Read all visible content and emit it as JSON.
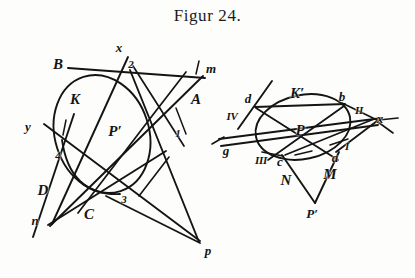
{
  "figure": {
    "title": "Figur 24.",
    "caption_style": "serif-roman",
    "ink_color": "#141414",
    "paper_color": "#fdfdfb",
    "type": "geometric-construction-plate"
  },
  "diagrams": [
    {
      "name": "left-diagram",
      "conic": {
        "name": "left-ellipse",
        "cx": 102,
        "cy": 134,
        "rx": 47,
        "ry": 60,
        "rotation_deg": -18
      },
      "labels": [
        {
          "id": "B",
          "text": "B",
          "x": 58,
          "y": 64,
          "size": "cap"
        },
        {
          "id": "x",
          "text": "x",
          "x": 119,
          "y": 47,
          "size": "small"
        },
        {
          "id": "2",
          "text": "2",
          "x": 131,
          "y": 64,
          "size": "num"
        },
        {
          "id": "m",
          "text": "m",
          "x": 211,
          "y": 68,
          "size": "small"
        },
        {
          "id": "A",
          "text": "A",
          "x": 196,
          "y": 99,
          "size": "cap"
        },
        {
          "id": "K",
          "text": "K",
          "x": 75,
          "y": 99,
          "size": "cap"
        },
        {
          "id": "y",
          "text": "y",
          "x": 28,
          "y": 126,
          "size": "small"
        },
        {
          "id": "Pp",
          "text": "P′",
          "x": 115,
          "y": 131,
          "size": "cap"
        },
        {
          "id": "1",
          "text": "1",
          "x": 178,
          "y": 133,
          "size": "num"
        },
        {
          "id": "4",
          "text": "4",
          "x": 58,
          "y": 155,
          "size": "num"
        },
        {
          "id": "D",
          "text": "D",
          "x": 43,
          "y": 190,
          "size": "cap"
        },
        {
          "id": "3",
          "text": "3",
          "x": 124,
          "y": 199,
          "size": "num"
        },
        {
          "id": "C",
          "text": "C",
          "x": 89,
          "y": 214,
          "size": "cap"
        },
        {
          "id": "n",
          "text": "n",
          "x": 35,
          "y": 220,
          "size": "small"
        },
        {
          "id": "p",
          "text": "p",
          "x": 208,
          "y": 250,
          "size": "small"
        }
      ]
    },
    {
      "name": "right-diagram",
      "conic": {
        "name": "right-ellipse",
        "cx": 303,
        "cy": 127,
        "rx": 48,
        "ry": 32,
        "rotation_deg": -12
      },
      "labels": [
        {
          "id": "Kp",
          "text": "K′",
          "x": 297,
          "y": 93,
          "size": "cap"
        },
        {
          "id": "d",
          "text": "d",
          "x": 248,
          "y": 98,
          "size": "small"
        },
        {
          "id": "b",
          "text": "b",
          "x": 342,
          "y": 96,
          "size": "small"
        },
        {
          "id": "IV",
          "text": "IV",
          "x": 232,
          "y": 116,
          "size": "roman"
        },
        {
          "id": "II",
          "text": "II",
          "x": 359,
          "y": 110,
          "size": "roman"
        },
        {
          "id": "xr",
          "text": "x",
          "x": 380,
          "y": 118,
          "size": "small"
        },
        {
          "id": "P",
          "text": "P",
          "x": 300,
          "y": 130,
          "size": "cap"
        },
        {
          "id": "I",
          "text": "I",
          "x": 347,
          "y": 146,
          "size": "roman"
        },
        {
          "id": "g",
          "text": "g",
          "x": 226,
          "y": 150,
          "size": "small"
        },
        {
          "id": "III",
          "text": "III",
          "x": 261,
          "y": 160,
          "size": "roman"
        },
        {
          "id": "c",
          "text": "c",
          "x": 280,
          "y": 161,
          "size": "small"
        },
        {
          "id": "a",
          "text": "a",
          "x": 335,
          "y": 157,
          "size": "small"
        },
        {
          "id": "M",
          "text": "M",
          "x": 330,
          "y": 174,
          "size": "cap"
        },
        {
          "id": "N",
          "text": "N",
          "x": 286,
          "y": 180,
          "size": "cap"
        },
        {
          "id": "Ppr",
          "text": "P′",
          "x": 312,
          "y": 213,
          "size": "small"
        }
      ]
    }
  ]
}
